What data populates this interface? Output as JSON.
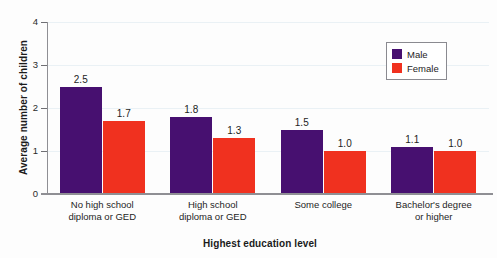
{
  "chart_data": {
    "type": "bar",
    "title": "",
    "xlabel": "Highest education level",
    "ylabel": "Average number of children",
    "categories": [
      "No high school\ndiploma or GED",
      "High school\ndiploma or GED",
      "Some college",
      "Bachelor's degree\nor higher"
    ],
    "category_lines": [
      [
        "No high school",
        "diploma or GED"
      ],
      [
        "High school",
        "diploma or GED"
      ],
      [
        "Some college",
        ""
      ],
      [
        "Bachelor's degree",
        "or higher"
      ]
    ],
    "series": [
      {
        "name": "Male",
        "values": [
          2.5,
          1.8,
          1.5,
          1.1
        ],
        "color": "#471070"
      },
      {
        "name": "Female",
        "values": [
          1.7,
          1.3,
          1.0,
          1.0
        ],
        "color": "#f0311f"
      }
    ],
    "value_labels": [
      [
        "2.5",
        "1.7"
      ],
      [
        "1.8",
        "1.3"
      ],
      [
        "1.5",
        "1.0"
      ],
      [
        "1.1",
        "1.0"
      ]
    ],
    "ylim": [
      0,
      4
    ],
    "yticks": [
      0,
      1,
      2,
      3,
      4
    ],
    "ytick_labels": [
      "0",
      "1",
      "2",
      "3",
      "4"
    ],
    "grid": true,
    "legend_position": "top-right"
  },
  "legend": {
    "entries": [
      {
        "label": "Male",
        "color": "#471070"
      },
      {
        "label": "Female",
        "color": "#f0311f"
      }
    ]
  },
  "colors": {
    "male": "#471070",
    "female": "#f0311f",
    "gridline": "#eaf1f5",
    "axis": "#8f8f94",
    "text": "#1d1d1d"
  }
}
